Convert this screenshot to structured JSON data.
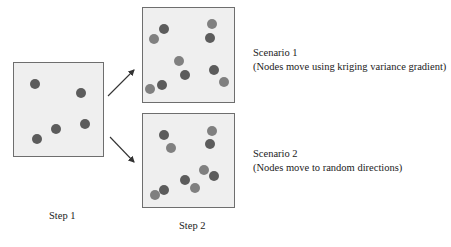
{
  "diagram": {
    "colors": {
      "panel_fill": "#efefef",
      "panel_border": "#6e6e6e",
      "node_original": "#5c5c5c",
      "node_moved": "#808080",
      "arrow": "#333333"
    },
    "step1": {
      "label": "Step 1",
      "nodes": [
        {
          "x": 35,
          "y": 84
        },
        {
          "x": 81,
          "y": 93
        },
        {
          "x": 56,
          "y": 129
        },
        {
          "x": 85,
          "y": 124
        },
        {
          "x": 37,
          "y": 139
        }
      ]
    },
    "step2": {
      "label": "Step 2",
      "scenarios": [
        {
          "title": "Scenario 1",
          "description": "(Nodes move using kriging variance gradient)",
          "original_nodes": [
            {
              "x": 164,
              "y": 29
            },
            {
              "x": 210,
              "y": 38
            },
            {
              "x": 185,
              "y": 75
            },
            {
              "x": 162,
              "y": 85
            },
            {
              "x": 214,
              "y": 70
            }
          ],
          "moved_nodes": [
            {
              "x": 154,
              "y": 39
            },
            {
              "x": 212,
              "y": 24
            },
            {
              "x": 179,
              "y": 61
            },
            {
              "x": 150,
              "y": 89
            },
            {
              "x": 224,
              "y": 82
            }
          ]
        },
        {
          "title": "Scenario 2",
          "description": "(Nodes move to random directions)",
          "original_nodes": [
            {
              "x": 164,
              "y": 135
            },
            {
              "x": 210,
              "y": 144
            },
            {
              "x": 185,
              "y": 180
            },
            {
              "x": 164,
              "y": 190
            },
            {
              "x": 214,
              "y": 176
            }
          ],
          "moved_nodes": [
            {
              "x": 171,
              "y": 148
            },
            {
              "x": 212,
              "y": 131
            },
            {
              "x": 204,
              "y": 170
            },
            {
              "x": 195,
              "y": 188
            },
            {
              "x": 155,
              "y": 195
            }
          ]
        }
      ]
    }
  }
}
